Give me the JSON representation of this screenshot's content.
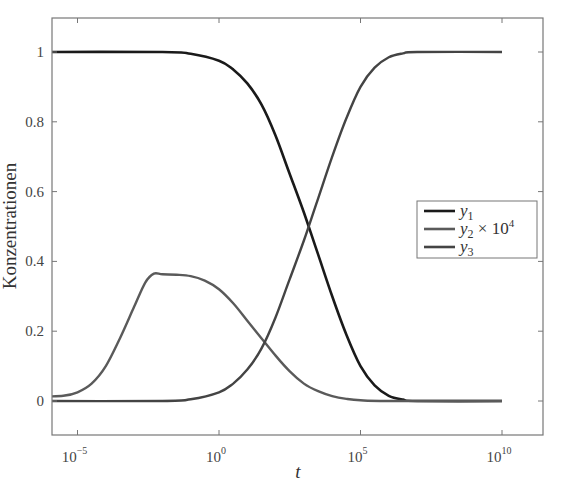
{
  "chart_data": {
    "type": "line",
    "title": "",
    "xlabel": "t",
    "ylabel": "Konzentrationen",
    "xscale": "log",
    "xlim_log10": [
      -6.5,
      10
    ],
    "ylim": [
      -0.1,
      1.1
    ],
    "grid": false,
    "legend_position": "center-right",
    "x_ticks": [
      {
        "base": "10",
        "exp": "−5",
        "log10": -5
      },
      {
        "base": "10",
        "exp": "0",
        "log10": 0
      },
      {
        "base": "10",
        "exp": "5",
        "log10": 5
      },
      {
        "base": "10",
        "exp": "10",
        "log10": 10
      }
    ],
    "y_ticks": [
      {
        "label": "0",
        "value": 0
      },
      {
        "label": "0.2",
        "value": 0.2
      },
      {
        "label": "0.4",
        "value": 0.4
      },
      {
        "label": "0.6",
        "value": 0.6
      },
      {
        "label": "0.8",
        "value": 0.8
      },
      {
        "label": "1",
        "value": 1
      }
    ],
    "series": [
      {
        "name": "y1",
        "legend_base": "y",
        "legend_sub": "1",
        "legend_suffix": "",
        "color": "#1a1a1a",
        "width": 2.6,
        "log10_t": [
          -6.5,
          -2,
          -1,
          0,
          0.5,
          1,
          1.5,
          2,
          2.5,
          3,
          3.5,
          4,
          4.5,
          5,
          5.5,
          6,
          6.5,
          7,
          10
        ],
        "values": [
          1.0,
          1.0,
          0.995,
          0.975,
          0.95,
          0.91,
          0.85,
          0.76,
          0.65,
          0.54,
          0.42,
          0.3,
          0.19,
          0.1,
          0.045,
          0.015,
          0.004,
          0.0,
          0.0
        ]
      },
      {
        "name": "y2 × 10^4",
        "legend_base": "y",
        "legend_sub": "2",
        "legend_suffix": " × 10",
        "legend_sup": "4",
        "color": "#5a5a5a",
        "width": 2.4,
        "log10_t": [
          -6.5,
          -5.5,
          -5,
          -4.5,
          -4,
          -3.5,
          -3,
          -2.6,
          -2.3,
          -2,
          -1.5,
          -1,
          -0.5,
          0,
          0.5,
          1,
          1.5,
          2,
          2.5,
          3,
          3.5,
          4,
          4.5,
          5,
          6,
          10
        ],
        "values": [
          0.012,
          0.015,
          0.025,
          0.05,
          0.1,
          0.18,
          0.27,
          0.34,
          0.365,
          0.363,
          0.362,
          0.358,
          0.345,
          0.32,
          0.28,
          0.23,
          0.18,
          0.13,
          0.085,
          0.05,
          0.028,
          0.014,
          0.006,
          0.002,
          0.0,
          0.0
        ]
      },
      {
        "name": "y3",
        "legend_base": "y",
        "legend_sub": "3",
        "legend_suffix": "",
        "color": "#444444",
        "width": 2.4,
        "log10_t": [
          -6.5,
          -2,
          -1,
          0,
          0.5,
          1,
          1.5,
          2,
          2.5,
          3,
          3.5,
          4,
          4.5,
          5,
          5.5,
          6,
          6.5,
          7,
          10
        ],
        "values": [
          0.0,
          0.0,
          0.005,
          0.025,
          0.05,
          0.09,
          0.15,
          0.24,
          0.35,
          0.46,
          0.58,
          0.7,
          0.81,
          0.9,
          0.955,
          0.985,
          0.996,
          1.0,
          1.0
        ]
      }
    ]
  }
}
